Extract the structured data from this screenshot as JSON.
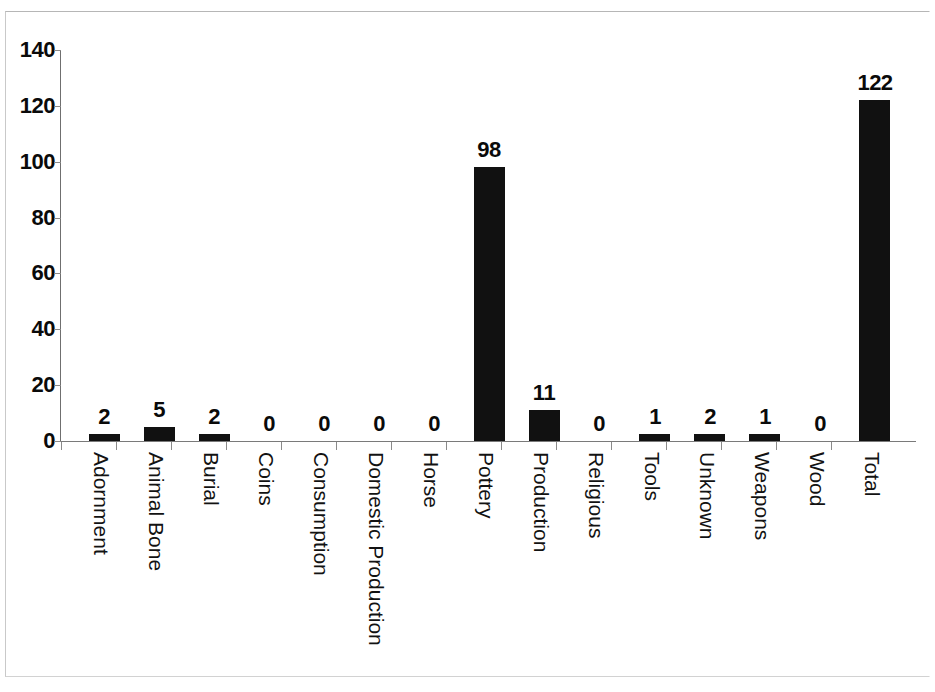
{
  "chart_data": {
    "type": "bar",
    "title": "",
    "subtitle": "",
    "xlabel": "",
    "ylabel": "",
    "ylim": [
      0,
      140
    ],
    "ytick_step": 20,
    "yticks": [
      0,
      20,
      40,
      60,
      80,
      100,
      120,
      140
    ],
    "ytick_labels": [
      "0",
      "20",
      "40",
      "60",
      "80",
      "100",
      "120",
      "140"
    ],
    "grid": false,
    "legend": false,
    "legend_position": "none",
    "show_data_labels": true,
    "bar_color": "#111111",
    "categories": [
      "Adornment",
      "Animal Bone",
      "Burial",
      "Coins",
      "Consumption",
      "Domestic Production",
      "Horse",
      "Pottery",
      "Production",
      "Religious",
      "Tools",
      "Unknown",
      "Weapons",
      "Wood",
      "Total"
    ],
    "values": [
      2,
      5,
      2,
      0,
      0,
      0,
      0,
      98,
      11,
      0,
      1,
      2,
      1,
      0,
      122
    ],
    "data_labels": [
      "2",
      "5",
      "2",
      "0",
      "0",
      "0",
      "0",
      "98",
      "11",
      "0",
      "1",
      "2",
      "1",
      "0",
      "122"
    ]
  }
}
